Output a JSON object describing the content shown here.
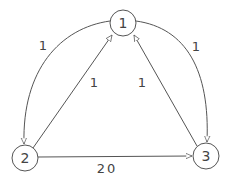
{
  "diagram": {
    "type": "directed-weighted-graph",
    "colors": {
      "stroke": "#555555",
      "text": "#444444",
      "background": "#ffffff"
    },
    "nodes": [
      {
        "id": "1",
        "label": "1"
      },
      {
        "id": "2",
        "label": "2"
      },
      {
        "id": "3",
        "label": "3"
      }
    ],
    "edges": [
      {
        "from": "1",
        "to": "2",
        "weight": "1",
        "shape": "arc-left"
      },
      {
        "from": "1",
        "to": "3",
        "weight": "1",
        "shape": "arc-right"
      },
      {
        "from": "2",
        "to": "1",
        "weight": "1",
        "shape": "straight"
      },
      {
        "from": "3",
        "to": "1",
        "weight": "1",
        "shape": "straight"
      },
      {
        "from": "2",
        "to": "3",
        "weight": "20",
        "shape": "straight"
      }
    ]
  }
}
